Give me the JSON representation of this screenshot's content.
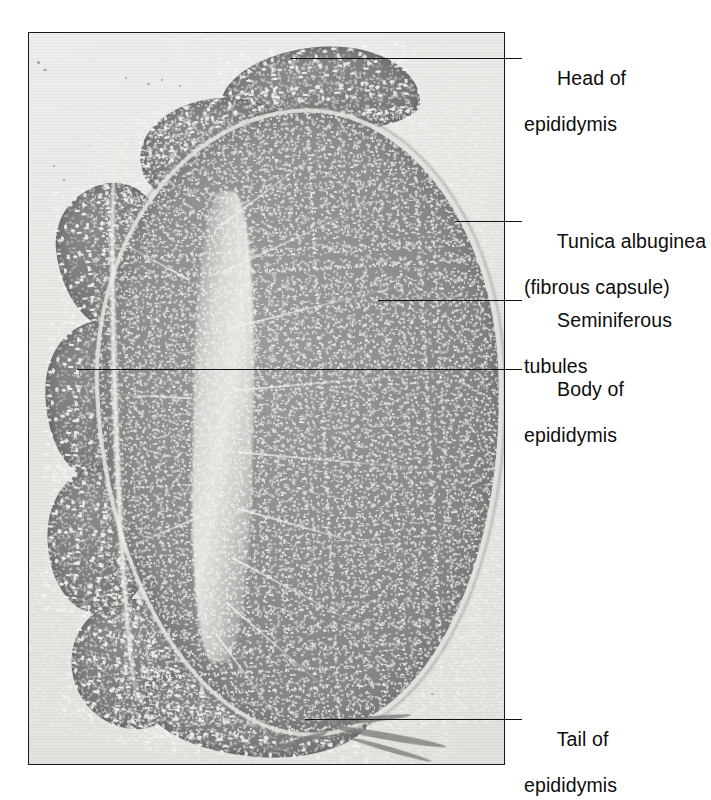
{
  "figure": {
    "type": "histological micrograph",
    "plate": {
      "x": 28,
      "y": 32,
      "width": 477,
      "height": 733,
      "border_color": "#1a1a1a",
      "background_color": "#e8e8e6",
      "rendering": "grayscale"
    },
    "colors": {
      "plate_background": "#e8e8e6",
      "testis_parenchyma": "#8e8e8c",
      "epididymis": "#7e7e7c",
      "tunica_albuginea": "#e1e1dd",
      "leader_line": "#111111",
      "label_text": "#0d0d0d"
    }
  },
  "labels": [
    {
      "id": "head-of-epididymis",
      "line1": "Head of",
      "line2": "epididymis",
      "text_x": 524,
      "text_y": 44,
      "leader": {
        "x": 290,
        "y": 58,
        "width": 232
      }
    },
    {
      "id": "tunica-albuginea",
      "line1": "Tunica albuginea",
      "line2": "(fibrous capsule)",
      "text_x": 524,
      "text_y": 207,
      "leader": {
        "x": 455,
        "y": 221,
        "width": 67
      }
    },
    {
      "id": "seminiferous-tubules",
      "line1": "Seminiferous",
      "line2": "tubules",
      "text_x": 524,
      "text_y": 286,
      "leader": {
        "x": 378,
        "y": 300,
        "width": 144
      }
    },
    {
      "id": "body-of-epididymis",
      "line1": "Body of",
      "line2": "epididymis",
      "text_x": 524,
      "text_y": 355,
      "leader": {
        "x": 77,
        "y": 369,
        "width": 445
      }
    },
    {
      "id": "tail-of-epididymis",
      "line1": "Tail of",
      "line2": "epididymis",
      "text_x": 524,
      "text_y": 705,
      "leader": {
        "x": 305,
        "y": 719,
        "width": 217
      }
    }
  ],
  "structures": [
    {
      "id": "testis-body",
      "name": "Testis parenchyma (seminiferous tubules)"
    },
    {
      "id": "mediastinum",
      "name": "Mediastinum testis / rete testis"
    },
    {
      "id": "tunica",
      "name": "Tunica albuginea (fibrous capsule)"
    },
    {
      "id": "epi-head",
      "name": "Head of epididymis (caput)"
    },
    {
      "id": "epi-body",
      "name": "Body of epididymis (corpus)"
    },
    {
      "id": "epi-tail",
      "name": "Tail of epididymis (cauda)"
    }
  ]
}
